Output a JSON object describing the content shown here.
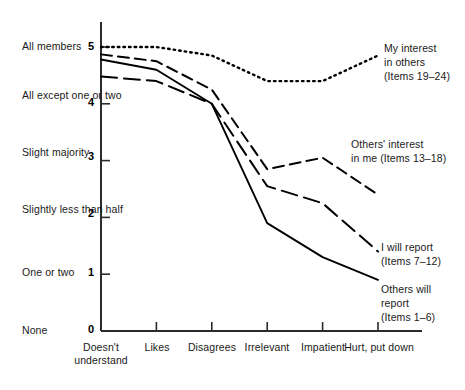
{
  "chart_data": {
    "type": "line",
    "title": "",
    "xlabel": "",
    "ylabel": "",
    "grid": false,
    "legend_position": "inline-right",
    "categories": [
      "Doesn't understand",
      "Likes",
      "Disagrees",
      "Irrelevant",
      "Impatient",
      "Hurt, put down"
    ],
    "ylim": [
      0,
      5.35
    ],
    "yticks": [
      0,
      1,
      2,
      3,
      4,
      5
    ],
    "ytick_labels": [
      "0",
      "1",
      "2",
      "3",
      "4",
      "5"
    ],
    "ytick_descriptions": [
      "None",
      "One or two",
      "Slightly less than half",
      "Slight majority",
      "All except one or two",
      "All members"
    ],
    "series": [
      {
        "name": "My interest in others (Items 19-24)",
        "style": "dotted",
        "values": [
          5.0,
          5.0,
          4.85,
          4.4,
          4.4,
          4.85
        ]
      },
      {
        "name": "Others' interest in me (Items 13-18)",
        "style": "dashed",
        "values": [
          4.87,
          4.75,
          4.25,
          2.85,
          3.05,
          2.4
        ]
      },
      {
        "name": "I will report (Items 7-12)",
        "style": "long-dash",
        "values": [
          4.48,
          4.4,
          4.0,
          2.55,
          2.25,
          1.4
        ]
      },
      {
        "name": "Others will report (Items 1-6)",
        "style": "solid",
        "values": [
          4.78,
          4.6,
          4.0,
          1.9,
          1.3,
          0.9
        ]
      }
    ]
  },
  "axis": {
    "y_descriptions": [
      {
        "text": "All members",
        "value": 5
      },
      {
        "text": "All except\none or two",
        "value": 4
      },
      {
        "text": "Slight\nmajority",
        "value": 3
      },
      {
        "text": "Slightly less\nthan half",
        "value": 2
      },
      {
        "text": "One or two",
        "value": 1
      },
      {
        "text": "None",
        "value": 0
      }
    ],
    "y_numbers": [
      "5",
      "4",
      "3",
      "2",
      "1",
      "0"
    ],
    "x_categories": [
      "Doesn't\nunderstand",
      "Likes",
      "Disagrees",
      "Irrelevant",
      "Impatient",
      "Hurt, put down"
    ]
  },
  "series_labels": [
    {
      "id": "my-interest",
      "text": "My interest\nin others\n(Items 19–24)"
    },
    {
      "id": "others-interest",
      "text": "Others' interest\nin me (Items 13–18)"
    },
    {
      "id": "i-will-report",
      "text": "I will report\n(Items 7–12)"
    },
    {
      "id": "others-will-report",
      "text": "Others will\nreport\n(Items 1–6)"
    }
  ],
  "colors": {
    "line": "#000000",
    "axis": "#2b2b2b",
    "text": "#1a1a1a",
    "background": "#ffffff"
  }
}
